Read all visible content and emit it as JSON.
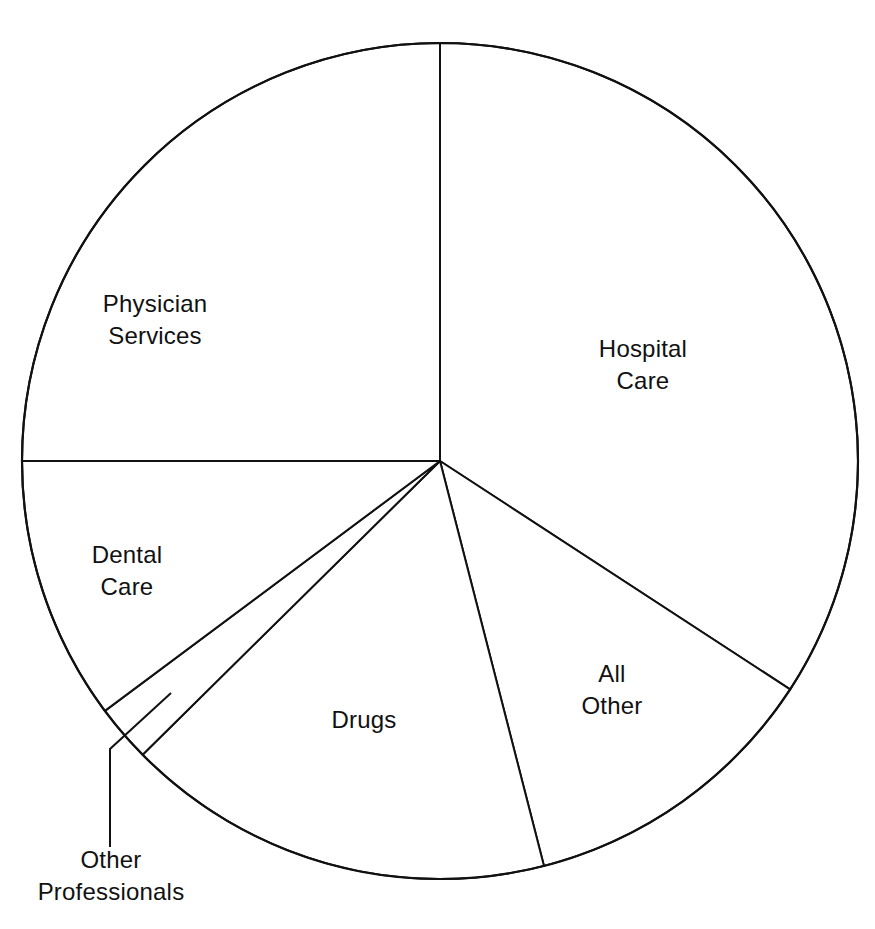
{
  "chart_data": {
    "type": "pie",
    "title": "",
    "start_angle_deg": 0,
    "direction": "clockwise",
    "categories": [
      "Hospital Care",
      "All Other",
      "Drugs",
      "Other Professionals",
      "Dental Care",
      "Physician Services"
    ],
    "values": [
      34.2,
      11.8,
      16.6,
      2.2,
      10.2,
      25.0
    ],
    "unit": "percent (estimated from slice angles)",
    "labels_inside": true,
    "callout": {
      "category": "Other Professionals",
      "style": "leader-line-below"
    },
    "fill_color": "#ffffff",
    "stroke_color": "#111111"
  },
  "labels": {
    "hospital": {
      "line1": "Hospital",
      "line2": "Care"
    },
    "all_other": {
      "line1": "All",
      "line2": "Other"
    },
    "drugs": {
      "line1": "Drugs"
    },
    "other_prof": {
      "line1": "Other",
      "line2": "Professionals"
    },
    "dental": {
      "line1": "Dental",
      "line2": "Care"
    },
    "physician": {
      "line1": "Physician",
      "line2": "Services"
    }
  }
}
